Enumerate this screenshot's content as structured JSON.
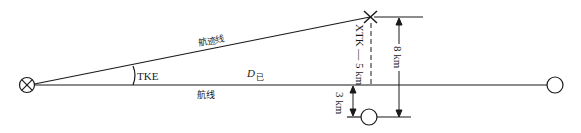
{
  "diagram": {
    "type": "navigation-cross-track-error",
    "labels": {
      "track_line": "航迹线",
      "course_line": "航线",
      "track_angle_error": "TKE",
      "distance_flown_main": "D",
      "distance_flown_sub": "已",
      "xtk": "XTK — 5 km",
      "dim_8km": "8 km",
      "dim_3km": "3 km"
    },
    "symbols": {
      "origin": "crossed-circle-icon",
      "destination": "circle-icon",
      "present_position": "x-mark-icon",
      "offset_point": "circle-icon"
    },
    "colors": {
      "line": "#1a1a1a",
      "background": "#ffffff"
    }
  }
}
